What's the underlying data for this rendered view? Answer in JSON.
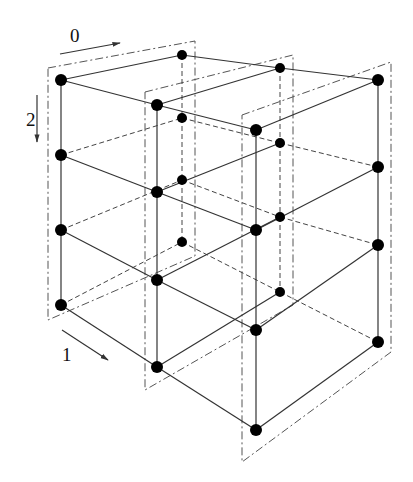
{
  "figure": {
    "axis_labels": [
      {
        "name": "axis-0",
        "text": "0",
        "x": 70,
        "y": 42,
        "arrow": [
          60,
          54,
          120,
          43
        ]
      },
      {
        "name": "axis-1",
        "text": "1",
        "x": 62,
        "y": 361,
        "arrow": [
          62,
          330,
          108,
          360
        ]
      },
      {
        "name": "axis-2",
        "text": "2",
        "x": 26,
        "y": 126,
        "arrow": [
          37,
          95,
          37,
          142
        ]
      }
    ],
    "planes": [
      {
        "name": "plane-j0",
        "nodes": [
          [
            [
              61,
              80
            ],
            [
              61,
              155
            ],
            [
              61,
              230
            ],
            [
              61,
              305
            ]
          ],
          [
            [
              182,
              55
            ],
            [
              182,
              118
            ],
            [
              182,
              180
            ],
            [
              182,
              242
            ]
          ]
        ],
        "frame": [
          [
            48,
            68
          ],
          [
            195,
            41
          ],
          [
            195,
            256
          ],
          [
            48,
            320
          ]
        ]
      },
      {
        "name": "plane-j1",
        "nodes": [
          [
            [
              157,
              105
            ],
            [
              157,
              192
            ],
            [
              157,
              280
            ],
            [
              157,
              367
            ]
          ],
          [
            [
              280,
              68
            ],
            [
              280,
              143
            ],
            [
              280,
              217
            ],
            [
              280,
              292
            ]
          ]
        ],
        "frame": [
          [
            145,
            92
          ],
          [
            293,
            55
          ],
          [
            293,
            305
          ],
          [
            145,
            390
          ]
        ]
      },
      {
        "name": "plane-j2",
        "nodes": [
          [
            [
              256,
              130
            ],
            [
              256,
              230
            ],
            [
              256,
              330
            ],
            [
              256,
              430
            ]
          ],
          [
            [
              378,
              80
            ],
            [
              378,
              167
            ],
            [
              378,
              245
            ],
            [
              378,
              342
            ]
          ]
        ],
        "frame": [
          [
            242,
            115
          ],
          [
            391,
            62
          ],
          [
            391,
            352
          ],
          [
            242,
            462
          ]
        ]
      }
    ],
    "colors": {
      "solid": "#333333",
      "dashed": "#444444",
      "frame": "#555555",
      "node": "#000000"
    }
  }
}
